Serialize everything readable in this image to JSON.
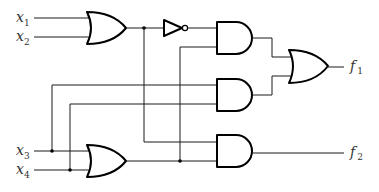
{
  "diagram": {
    "type": "logic-circuit",
    "inputs": [
      {
        "name": "x",
        "sub": "1"
      },
      {
        "name": "x",
        "sub": "2"
      },
      {
        "name": "x",
        "sub": "3"
      },
      {
        "name": "x",
        "sub": "4"
      }
    ],
    "outputs": [
      {
        "name": "f",
        "sub": "1"
      },
      {
        "name": "f",
        "sub": "2"
      }
    ],
    "gates": [
      {
        "id": "or1",
        "type": "OR",
        "inputs": [
          "x1",
          "x2"
        ]
      },
      {
        "id": "not1",
        "type": "NOT",
        "inputs": [
          "or1"
        ]
      },
      {
        "id": "or2",
        "type": "OR",
        "inputs": [
          "x3",
          "x4"
        ]
      },
      {
        "id": "and1",
        "type": "AND",
        "inputs": [
          "not1",
          "or2"
        ]
      },
      {
        "id": "and2",
        "type": "AND",
        "inputs": [
          "x3",
          "x4"
        ]
      },
      {
        "id": "and3",
        "type": "AND",
        "inputs": [
          "or1",
          "or2"
        ]
      },
      {
        "id": "or3",
        "type": "OR",
        "inputs": [
          "and1",
          "and2"
        ],
        "output": "f1"
      }
    ],
    "f2_source": "and3",
    "colors": {
      "line": "#000000",
      "background": "#ffffff",
      "label": "#333333"
    }
  }
}
